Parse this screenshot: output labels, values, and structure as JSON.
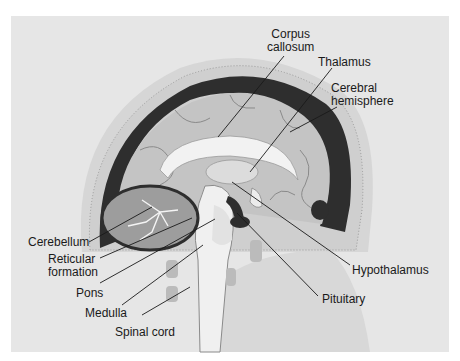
{
  "figure": {
    "labels": {
      "corpus_callosum": "Corpus\ncallosum",
      "thalamus": "Thalamus",
      "cerebral_hemisphere": "Cerebral\nhemisphere",
      "cerebellum": "Cerebellum",
      "reticular_formation": "Reticular\nformation",
      "pons": "Pons",
      "medulla": "Medulla",
      "spinal_cord": "Spinal cord",
      "hypothalamus": "Hypothalamus",
      "pituitary": "Pituitary"
    },
    "colors": {
      "background": "#e6e6e6",
      "skull": "#d2d2d2",
      "dura": "#2e2e2e",
      "cortex": "#c4c4c4",
      "white_matter": "#eeeeee",
      "leader_line": "#1a1a1a"
    }
  }
}
